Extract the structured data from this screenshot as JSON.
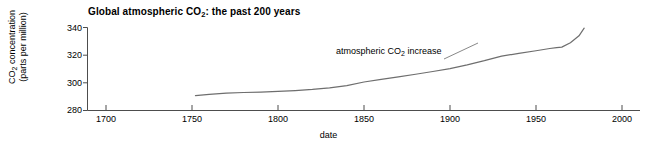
{
  "chart_data": {
    "type": "line",
    "title": "Global atmospheric CO2: the past 200 years",
    "title_main": "Global atmospheric CO",
    "title_sub": "2",
    "title_tail": ": the past 200 years",
    "xlabel": "date",
    "ylabel_line1_main": "CO",
    "ylabel_line1_sub": "2",
    "ylabel_line1_tail": " concentration",
    "ylabel_line2": "(parts per million)",
    "ylabel": "CO2 concentration (parts per million)",
    "xlim": [
      1690,
      2000
    ],
    "ylim": [
      278,
      341
    ],
    "xticks": [
      1700,
      1750,
      1800,
      1850,
      1900,
      1950,
      2000
    ],
    "xtick_labels": [
      "1700",
      "1750",
      "1800",
      "1850",
      "1900",
      "1950",
      "2000"
    ],
    "yticks": [
      280,
      300,
      320,
      340
    ],
    "ytick_labels": [
      "280",
      "300",
      "320",
      "340"
    ],
    "grid": false,
    "legend": "none",
    "line_color": "#6e6e6e",
    "axis_color": "#4d4d4d",
    "series": [
      {
        "name": "atmospheric CO2 increase",
        "annotation_main": "atmospheric CO",
        "annotation_sub": "2",
        "annotation_tail": " increase",
        "x": [
          1752,
          1760,
          1770,
          1780,
          1790,
          1800,
          1810,
          1820,
          1830,
          1840,
          1850,
          1860,
          1870,
          1880,
          1890,
          1900,
          1910,
          1920,
          1930,
          1940,
          1950,
          1958,
          1962,
          1965,
          1970,
          1975,
          1978
        ],
        "values": [
          290.8,
          291.7,
          292.6,
          293.0,
          293.3,
          293.8,
          294.4,
          295.2,
          296.3,
          298.0,
          300.6,
          302.5,
          304.3,
          306.2,
          308.2,
          310.3,
          313.0,
          316.0,
          319.3,
          321.3,
          323.2,
          324.8,
          325.5,
          325.8,
          329.0,
          334.0,
          339.5
        ],
        "units": "parts per million"
      }
    ]
  }
}
